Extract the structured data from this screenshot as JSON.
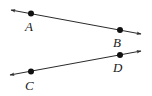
{
  "diagram": {
    "type": "geometry-lines",
    "colors": {
      "stroke": "#2a2a2a",
      "point": "#111111",
      "text": "#1a1a1a",
      "background": "#ffffff"
    },
    "lines": [
      {
        "name": "line-AB",
        "start_arrow": [
          11,
          10
        ],
        "end_arrow": [
          141,
          34
        ],
        "points": [
          {
            "label": "A",
            "x": 31,
            "y": 13.5,
            "label_x": 25,
            "label_y": 31
          },
          {
            "label": "B",
            "x": 120,
            "y": 30,
            "label_x": 113,
            "label_y": 47
          }
        ]
      },
      {
        "name": "line-CD",
        "start_arrow": [
          10,
          75
        ],
        "end_arrow": [
          141,
          51
        ],
        "points": [
          {
            "label": "C",
            "x": 31,
            "y": 71.5,
            "label_x": 25,
            "label_y": 90
          },
          {
            "label": "D",
            "x": 120,
            "y": 55,
            "label_x": 113,
            "label_y": 72
          }
        ]
      }
    ]
  }
}
